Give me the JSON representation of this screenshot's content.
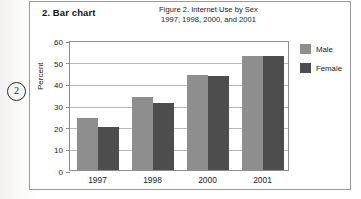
{
  "margin_marker": "2",
  "panel": {
    "section_title": "2.  Bar chart",
    "caption_line1": "Figure 2. Internet Use by Sex",
    "caption_line2": "1997, 1998, 2000, and 2001"
  },
  "colors": {
    "male": "#8e8e8e",
    "female": "#4d4d4d",
    "gridline": "#b9b9b9",
    "axis": "#8c8c8c",
    "panel_border": "#9a9a9a"
  },
  "chart_data": {
    "type": "bar",
    "title": "Figure 2. Internet Use by Sex",
    "subtitle": "1997, 1998, 2000, and 2001",
    "xlabel": "",
    "ylabel": "Percent",
    "ylim": [
      0,
      60
    ],
    "yticks": [
      0,
      10,
      20,
      30,
      40,
      50,
      60
    ],
    "grid": true,
    "legend_position": "right",
    "categories": [
      "1997",
      "1998",
      "2000",
      "2001"
    ],
    "series": [
      {
        "name": "Male",
        "values": [
          24.0,
          33.8,
          44.0,
          52.7
        ]
      },
      {
        "name": "Female",
        "values": [
          20.0,
          31.0,
          43.5,
          52.6
        ]
      }
    ]
  }
}
